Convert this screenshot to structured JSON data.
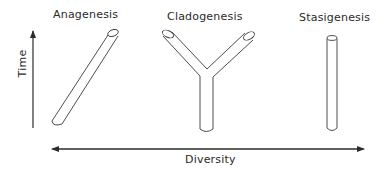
{
  "diagram": {
    "processes": [
      {
        "label": "Anagenesis",
        "shape": "single-slanted-tube"
      },
      {
        "label": "Cladogenesis",
        "shape": "branching-Y-tube"
      },
      {
        "label": "Stasigenesis",
        "shape": "single-vertical-tube"
      }
    ],
    "axes": {
      "y": {
        "label": "Time",
        "direction": "up"
      },
      "x": {
        "label": "Diversity",
        "direction": "both"
      }
    },
    "colors": {
      "line": "#3a3a3a",
      "text": "#2a2a2a",
      "background": "#ffffff"
    }
  }
}
